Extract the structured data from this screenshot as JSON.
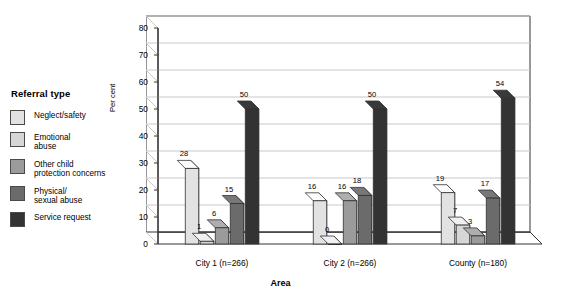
{
  "legend": {
    "title": "Referral type",
    "items": [
      {
        "label": "Neglect/safety",
        "color": "#e2e2e2"
      },
      {
        "label": "Emotional\nabuse",
        "color": "#d6d6d6"
      },
      {
        "label": "Other child\nprotection concerns",
        "color": "#9b9b9b"
      },
      {
        "label": "Physical/\nsexual abuse",
        "color": "#6b6b6b"
      },
      {
        "label": "Service request",
        "color": "#333333"
      }
    ]
  },
  "axes": {
    "ylabel": "Per cent",
    "xlabel": "Area",
    "yticks": [
      "0",
      "10",
      "20",
      "30",
      "40",
      "50",
      "60",
      "70",
      "80"
    ]
  },
  "chart_data": {
    "type": "bar",
    "title": "",
    "xlabel": "Area",
    "ylabel": "Per cent",
    "ylim": [
      0,
      80
    ],
    "ytick_step": 10,
    "grid": true,
    "legend_position": "left",
    "three_d": true,
    "categories": [
      "City 1 (n=266)",
      "City 2 (n=266)",
      "County (n=180)"
    ],
    "series": [
      {
        "name": "Neglect/safety",
        "color": "#e2e2e2",
        "values": [
          28,
          16,
          19
        ]
      },
      {
        "name": "Emotional abuse",
        "color": "#d6d6d6",
        "values": [
          1,
          0,
          7
        ]
      },
      {
        "name": "Other child protection concerns",
        "color": "#9b9b9b",
        "values": [
          6,
          16,
          3
        ]
      },
      {
        "name": "Physical/sexual abuse",
        "color": "#6b6b6b",
        "values": [
          15,
          18,
          17
        ]
      },
      {
        "name": "Service request",
        "color": "#333333",
        "values": [
          50,
          50,
          54
        ]
      }
    ],
    "data_labels": [
      [
        "28",
        "1",
        "6",
        "15",
        "50"
      ],
      [
        "16",
        "0",
        "16",
        "18",
        "50"
      ],
      [
        "19",
        "7",
        "3",
        "17",
        "54"
      ]
    ]
  }
}
